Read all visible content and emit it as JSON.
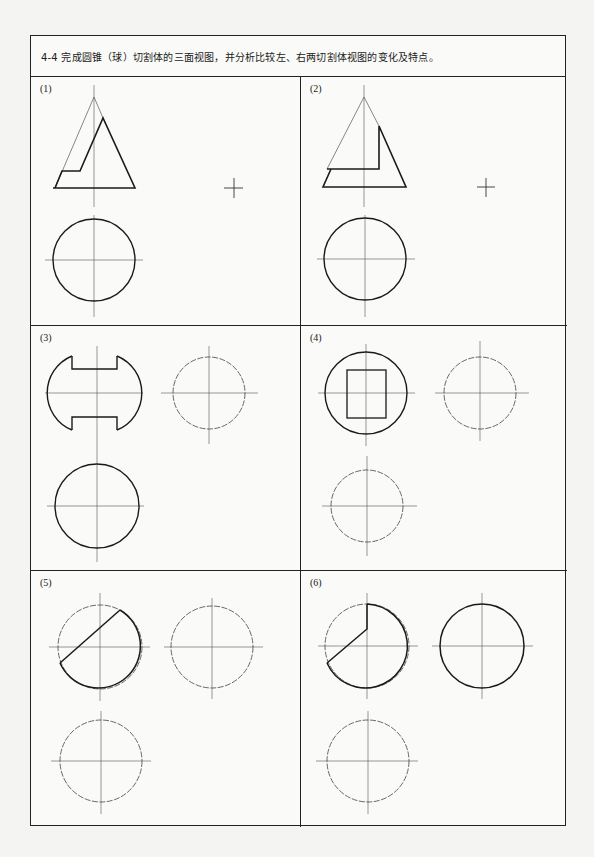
{
  "exercise": {
    "title": "4-4 完成圆锥（球）切割体的三面视图，并分析比较左、右两切割体视图的变化及特点。"
  },
  "panels": [
    {
      "label": "(1)",
      "subject": "cone-cut-inclined"
    },
    {
      "label": "(2)",
      "subject": "cone-cut-vertical"
    },
    {
      "label": "(3)",
      "subject": "sphere-slotted"
    },
    {
      "label": "(4)",
      "subject": "sphere-square-hole"
    },
    {
      "label": "(5)",
      "subject": "sphere-cut-inclined"
    },
    {
      "label": "(6)",
      "subject": "sphere-cut-quarter"
    }
  ],
  "colors": {
    "line": "#1a1a1a",
    "thin_line": "#555555",
    "background": "#fafaf8"
  }
}
